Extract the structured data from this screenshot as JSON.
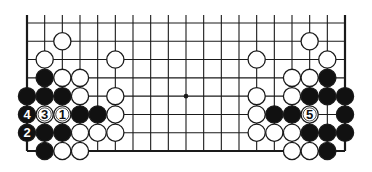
{
  "diagram": {
    "type": "go-board-partial",
    "board_size": 19,
    "visible_rows": 8,
    "bottom_edge_visible": true,
    "top_edge_visible": false,
    "geometry": {
      "left_x": 27,
      "right_x": 345,
      "top_y": 23,
      "bottom_y": 151,
      "line_top_extension_y": 15,
      "stone_radius": 8.6
    },
    "colors": {
      "line": "#1a1a1a",
      "black_stone": "#111111",
      "white_stone": "#ffffff",
      "background": "#ffffff"
    },
    "hoshi": [
      {
        "col": 9,
        "row": 4
      }
    ],
    "stones": [
      {
        "col": 2,
        "row": 1,
        "color": "white"
      },
      {
        "col": 1,
        "row": 2,
        "color": "white"
      },
      {
        "col": 5,
        "row": 2,
        "color": "white"
      },
      {
        "col": 1,
        "row": 3,
        "color": "black"
      },
      {
        "col": 2,
        "row": 3,
        "color": "white"
      },
      {
        "col": 3,
        "row": 3,
        "color": "white"
      },
      {
        "col": 0,
        "row": 4,
        "color": "black"
      },
      {
        "col": 1,
        "row": 4,
        "color": "black"
      },
      {
        "col": 2,
        "row": 4,
        "color": "black"
      },
      {
        "col": 3,
        "row": 4,
        "color": "white"
      },
      {
        "col": 5,
        "row": 4,
        "color": "white"
      },
      {
        "col": 0,
        "row": 5,
        "color": "black",
        "label": "4"
      },
      {
        "col": 1,
        "row": 5,
        "color": "white",
        "label": "3"
      },
      {
        "col": 2,
        "row": 5,
        "color": "white",
        "label": "1"
      },
      {
        "col": 3,
        "row": 5,
        "color": "black"
      },
      {
        "col": 4,
        "row": 5,
        "color": "black"
      },
      {
        "col": 5,
        "row": 5,
        "color": "white"
      },
      {
        "col": 0,
        "row": 6,
        "color": "black",
        "label": "2"
      },
      {
        "col": 1,
        "row": 6,
        "color": "black"
      },
      {
        "col": 2,
        "row": 6,
        "color": "black"
      },
      {
        "col": 3,
        "row": 6,
        "color": "white"
      },
      {
        "col": 4,
        "row": 6,
        "color": "white"
      },
      {
        "col": 5,
        "row": 6,
        "color": "white"
      },
      {
        "col": 1,
        "row": 7,
        "color": "black"
      },
      {
        "col": 2,
        "row": 7,
        "color": "white"
      },
      {
        "col": 3,
        "row": 7,
        "color": "white"
      },
      {
        "col": 16,
        "row": 1,
        "color": "white"
      },
      {
        "col": 13,
        "row": 2,
        "color": "white"
      },
      {
        "col": 17,
        "row": 2,
        "color": "white"
      },
      {
        "col": 15,
        "row": 3,
        "color": "white"
      },
      {
        "col": 16,
        "row": 3,
        "color": "white"
      },
      {
        "col": 17,
        "row": 3,
        "color": "black"
      },
      {
        "col": 13,
        "row": 4,
        "color": "white"
      },
      {
        "col": 15,
        "row": 4,
        "color": "white"
      },
      {
        "col": 16,
        "row": 4,
        "color": "black"
      },
      {
        "col": 17,
        "row": 4,
        "color": "black"
      },
      {
        "col": 18,
        "row": 4,
        "color": "black"
      },
      {
        "col": 13,
        "row": 5,
        "color": "white"
      },
      {
        "col": 14,
        "row": 5,
        "color": "black"
      },
      {
        "col": 15,
        "row": 5,
        "color": "black"
      },
      {
        "col": 16,
        "row": 5,
        "color": "white",
        "label": "5"
      },
      {
        "col": 18,
        "row": 5,
        "color": "black"
      },
      {
        "col": 13,
        "row": 6,
        "color": "white"
      },
      {
        "col": 14,
        "row": 6,
        "color": "white"
      },
      {
        "col": 15,
        "row": 6,
        "color": "white"
      },
      {
        "col": 16,
        "row": 6,
        "color": "black"
      },
      {
        "col": 17,
        "row": 6,
        "color": "black"
      },
      {
        "col": 18,
        "row": 6,
        "color": "black"
      },
      {
        "col": 15,
        "row": 7,
        "color": "white"
      },
      {
        "col": 16,
        "row": 7,
        "color": "white"
      },
      {
        "col": 17,
        "row": 7,
        "color": "black"
      }
    ],
    "move_labels": [
      "1",
      "2",
      "3",
      "4",
      "5"
    ]
  }
}
